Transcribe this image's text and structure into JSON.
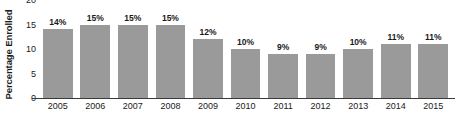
{
  "chart_data": {
    "type": "bar",
    "title": "",
    "xlabel": "",
    "ylabel": "Percentage Enrolled",
    "categories": [
      "2005",
      "2006",
      "2007",
      "2008",
      "2009",
      "2010",
      "2011",
      "2012",
      "2013",
      "2014",
      "2015"
    ],
    "values": [
      14,
      15,
      15,
      15,
      12,
      10,
      9,
      9,
      10,
      11,
      11
    ],
    "data_labels": [
      "14%",
      "15%",
      "15%",
      "15%",
      "12%",
      "10%",
      "9%",
      "9%",
      "10%",
      "11%",
      "11%"
    ],
    "ylim": [
      0,
      20
    ],
    "y_ticks": [
      0,
      5,
      10,
      15,
      20
    ],
    "y_tick_labels": [
      "0",
      "5",
      "10",
      "15",
      "20"
    ],
    "grid": false,
    "legend": "none",
    "bar_color": "#9a9a9a",
    "axis_color": "#3a3a3a",
    "text_color": "#1a1a1a",
    "background": "#ffffff"
  }
}
